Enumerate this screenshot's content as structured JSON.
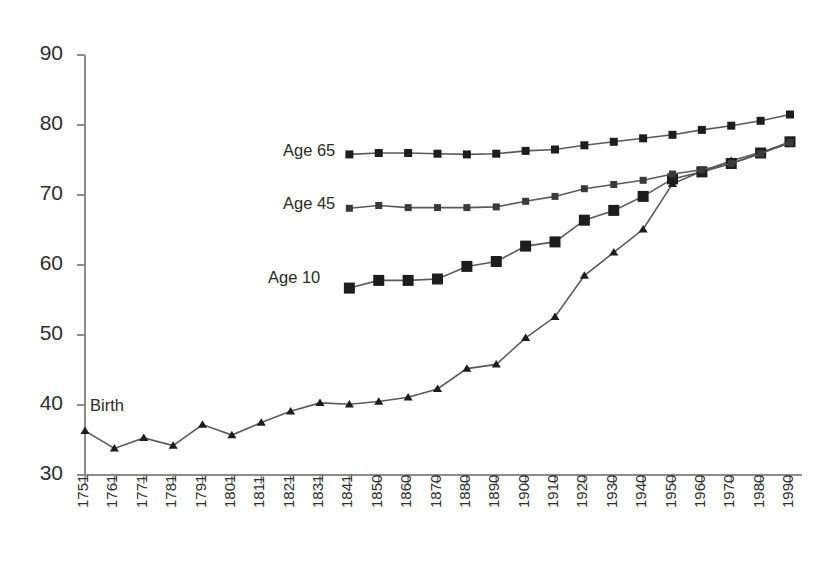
{
  "chart_data": {
    "type": "line",
    "title": "",
    "subtitle": "",
    "xlabel": "",
    "ylabel": "",
    "xlim": [
      1751,
      1990
    ],
    "ylim": [
      30,
      90
    ],
    "grid": false,
    "legend_position": "inline-left-of-line-start",
    "y_ticks": [
      30,
      40,
      50,
      60,
      70,
      80,
      90
    ],
    "x_ticks": [
      "1751",
      "1761",
      "1771",
      "1781",
      "1791",
      "1801",
      "1811",
      "1821",
      "1831",
      "1841",
      "1850",
      "1860",
      "1870",
      "1880",
      "1890",
      "1900",
      "1910",
      "1920",
      "1930",
      "1940",
      "1950",
      "1960",
      "1970",
      "1980",
      "1990"
    ],
    "series": [
      {
        "name": "Birth",
        "marker": "triangle",
        "color": "#1d1d1d",
        "x": [
          "1751",
          "1761",
          "1771",
          "1781",
          "1791",
          "1801",
          "1811",
          "1821",
          "1831",
          "1841",
          "1850",
          "1860",
          "1870",
          "1880",
          "1890",
          "1900",
          "1910",
          "1920",
          "1930",
          "1940",
          "1950",
          "1960",
          "1970",
          "1980",
          "1990"
        ],
        "values": [
          36.3,
          33.8,
          35.3,
          34.2,
          37.2,
          35.7,
          37.5,
          39.1,
          40.3,
          40.1,
          40.5,
          41.1,
          42.3,
          45.2,
          45.8,
          49.6,
          52.6,
          58.5,
          61.8,
          65.1,
          71.6,
          73.4,
          74.9,
          76.1,
          77.4
        ]
      },
      {
        "name": "Age 10",
        "marker": "square-large",
        "color": "#1d1d1d",
        "x": [
          "1841",
          "1850",
          "1860",
          "1870",
          "1880",
          "1890",
          "1900",
          "1910",
          "1920",
          "1930",
          "1940",
          "1950",
          "1960",
          "1970",
          "1980",
          "1990"
        ],
        "values": [
          56.7,
          57.8,
          57.8,
          58.0,
          59.8,
          60.5,
          62.7,
          63.3,
          66.4,
          67.8,
          69.8,
          72.3,
          73.3,
          74.5,
          76.0,
          77.6
        ]
      },
      {
        "name": "Age 45",
        "marker": "square-small",
        "color": "#3a3a3a",
        "x": [
          "1841",
          "1850",
          "1860",
          "1870",
          "1880",
          "1890",
          "1900",
          "1910",
          "1920",
          "1930",
          "1940",
          "1950",
          "1960",
          "1970",
          "1980",
          "1990"
        ],
        "values": [
          68.1,
          68.5,
          68.2,
          68.2,
          68.2,
          68.3,
          69.1,
          69.8,
          70.9,
          71.5,
          72.1,
          73.0,
          73.6,
          74.5,
          75.9,
          77.5
        ]
      },
      {
        "name": "Age 65",
        "marker": "square",
        "color": "#1d1d1d",
        "x": [
          "1841",
          "1850",
          "1860",
          "1870",
          "1880",
          "1890",
          "1900",
          "1910",
          "1920",
          "1930",
          "1940",
          "1950",
          "1960",
          "1970",
          "1980",
          "1990"
        ],
        "values": [
          75.8,
          76.0,
          76.0,
          75.9,
          75.8,
          75.9,
          76.3,
          76.5,
          77.1,
          77.6,
          78.1,
          78.6,
          79.3,
          79.9,
          80.6,
          81.5
        ]
      }
    ],
    "annotations": [
      {
        "text": "Age 65",
        "for_series": "Age 65"
      },
      {
        "text": "Age 45",
        "for_series": "Age 45"
      },
      {
        "text": "Age 10",
        "for_series": "Age 10"
      },
      {
        "text": "Birth",
        "for_series": "Birth"
      }
    ]
  },
  "axis": {
    "line_color": "#8c8c8c"
  }
}
